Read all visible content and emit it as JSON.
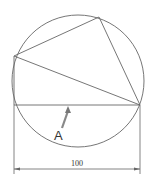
{
  "diagram": {
    "label_point": "A",
    "dimension": "100",
    "colors": {
      "stroke": "#555555",
      "arrow": "#777777",
      "text": "#333333"
    }
  }
}
